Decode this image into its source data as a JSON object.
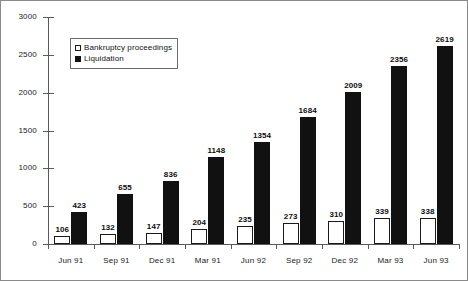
{
  "chart_data": {
    "type": "bar",
    "title": "",
    "subtitle": "",
    "xlabel": "",
    "ylabel": "",
    "ylim": [
      0,
      3000
    ],
    "ytick_step": 500,
    "yticks": [
      "0",
      "500",
      "1000",
      "1500",
      "2000",
      "2500",
      "3000"
    ],
    "grid": false,
    "legend_position": "upper-left-inside",
    "categories": [
      "Jun 91",
      "Sep 91",
      "Dec 91",
      "Mar 91",
      "Jun 92",
      "Sep 92",
      "Dec 92",
      "Mar 93",
      "Jun 93"
    ],
    "series": [
      {
        "name": "Bankruptcy proceedings",
        "style": "open",
        "color": "#ffffff",
        "edge_color": "#1a1a1a",
        "values": [
          106,
          132,
          147,
          204,
          235,
          273,
          310,
          339,
          338
        ],
        "labels": [
          "106",
          "132",
          "147",
          "204",
          "235",
          "273",
          "310",
          "339",
          "338"
        ]
      },
      {
        "name": "Liquidation",
        "style": "filled",
        "color": "#111111",
        "edge_color": "#111111",
        "values": [
          423,
          655,
          836,
          1148,
          1354,
          1684,
          2009,
          2356,
          2619
        ],
        "labels": [
          "423",
          "655",
          "836",
          "1148",
          "1354",
          "1684",
          "2009",
          "2356",
          "2619"
        ]
      }
    ]
  },
  "legend": {
    "entries": [
      {
        "label": "Bankruptcy proceedings"
      },
      {
        "label": "Liquidation"
      }
    ]
  }
}
